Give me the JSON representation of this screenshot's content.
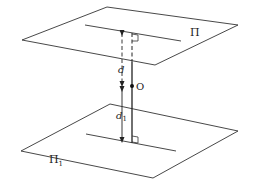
{
  "diagram": {
    "type": "geometry-two-parallel-planes",
    "labels": {
      "upper_plane": "Π",
      "lower_plane": "Π",
      "lower_plane_subscript": "1",
      "point": "O",
      "distance_upper": "d",
      "distance_lower": "d",
      "distance_lower_subscript": "1"
    },
    "colors": {
      "stroke": "#333333",
      "background": "#ffffff"
    }
  }
}
